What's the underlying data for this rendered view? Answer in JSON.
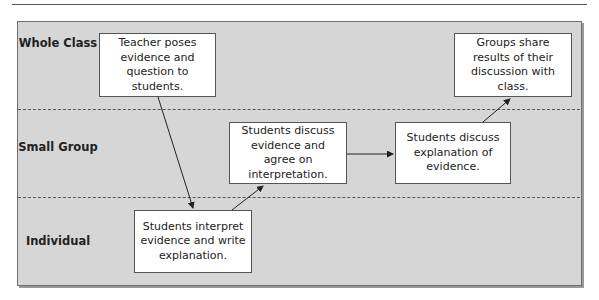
{
  "diagram": {
    "lanes": [
      {
        "id": "whole-class",
        "label": "Whole Class"
      },
      {
        "id": "small-group",
        "label": "Small Group"
      },
      {
        "id": "individual",
        "label": "Individual"
      }
    ],
    "steps": [
      {
        "id": "step1",
        "lane": "whole-class",
        "text": "Teacher poses evidence and question to students."
      },
      {
        "id": "step2",
        "lane": "individual",
        "text": "Students interpret evidence and write explanation."
      },
      {
        "id": "step3",
        "lane": "small-group",
        "text": "Students discuss evidence and agree on interpretation."
      },
      {
        "id": "step4",
        "lane": "small-group",
        "text": "Students discuss explanation of evidence."
      },
      {
        "id": "step5",
        "lane": "whole-class",
        "text": "Groups share results of their discussion with class."
      }
    ],
    "flow": [
      {
        "from": "step1",
        "to": "step2"
      },
      {
        "from": "step2",
        "to": "step3"
      },
      {
        "from": "step3",
        "to": "step4"
      },
      {
        "from": "step4",
        "to": "step5"
      }
    ],
    "colors": {
      "panel": "#d6d6d6",
      "box": "#ffffff",
      "line": "#333333"
    }
  }
}
